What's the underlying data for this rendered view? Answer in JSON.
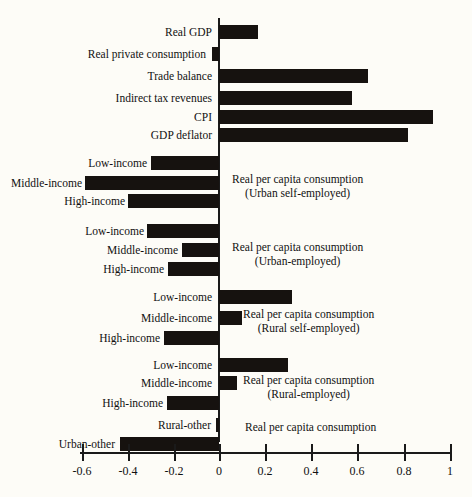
{
  "chart_data": {
    "type": "bar",
    "orientation": "horizontal",
    "title": "",
    "subtitle": "",
    "xlabel": "",
    "ylabel": "",
    "xlim": [
      -0.6,
      1.0
    ],
    "grid": false,
    "legend": "none",
    "axis": {
      "ticks": [
        -0.6,
        -0.4,
        -0.2,
        0,
        0.2,
        0.4,
        0.6,
        0.8,
        1
      ],
      "tick_labels": [
        "-0.6",
        "-0.4",
        "-0.2",
        "0",
        "0.2",
        "0.4",
        "0.6",
        "0.8",
        "1"
      ]
    },
    "categories": [
      "Real GDP",
      "Real private consumption",
      "Trade balance",
      "Indirect tax revenues",
      "CPI",
      "GDP deflator",
      "Low-income",
      "Middle-income",
      "High-income",
      "Low-income",
      "Middle-income",
      "High-income",
      "Low-income",
      "Middle-income",
      "High-income",
      "Low-income",
      "Middle-income",
      "High-income",
      "Rural-other",
      "Urban-other"
    ],
    "values": [
      0.17,
      -0.03,
      0.645,
      0.575,
      0.925,
      0.82,
      -0.295,
      -0.58,
      -0.395,
      -0.31,
      -0.16,
      -0.22,
      0.315,
      0.1,
      -0.24,
      0.3,
      0.078,
      -0.225,
      -0.015,
      -0.43
    ],
    "group_annotations": [
      "Real per capita consumption (Urban self-employed)",
      "Real per capita consumption (Urban-employed)",
      "Real per capita consumption (Rural self-employed)",
      "Real per capita consumption (Rural-employed)",
      "Real per capita consumption"
    ]
  },
  "bars": [
    {
      "label": "Real GDP",
      "value": 0.17,
      "top": 25,
      "label_right": 212
    },
    {
      "label": "Real private consumption",
      "value": -0.03,
      "top": 47,
      "label_right": 206
    },
    {
      "label": "Trade balance",
      "value": 0.645,
      "top": 69,
      "label_right": 212
    },
    {
      "label": "Indirect tax revenues",
      "value": 0.575,
      "top": 91,
      "label_right": 212
    },
    {
      "label": "CPI",
      "value": 0.925,
      "top": 110,
      "label_right": 212
    },
    {
      "label": "GDP deflator",
      "value": 0.82,
      "top": 128,
      "label_right": 212
    },
    {
      "label": "Low-income",
      "value": -0.295,
      "top": 156,
      "label_right": 147
    },
    {
      "label": "Middle-income",
      "value": -0.58,
      "top": 176,
      "label_right": 82
    },
    {
      "label": "High-income",
      "value": -0.395,
      "top": 194,
      "label_right": 125
    },
    {
      "label": "Low-income",
      "value": -0.31,
      "top": 224,
      "label_right": 144
    },
    {
      "label": "Middle-income",
      "value": -0.16,
      "top": 243,
      "label_right": 178
    },
    {
      "label": "High-income",
      "value": -0.22,
      "top": 262,
      "label_right": 164
    },
    {
      "label": "Low-income",
      "value": 0.315,
      "top": 290,
      "label_right": 212
    },
    {
      "label": "Middle-income",
      "value": 0.1,
      "top": 311,
      "label_right": 212
    },
    {
      "label": "High-income",
      "value": -0.24,
      "top": 331,
      "label_right": 160
    },
    {
      "label": "Low-income",
      "value": 0.3,
      "top": 358,
      "label_right": 212
    },
    {
      "label": "Middle-income",
      "value": 0.078,
      "top": 376,
      "label_right": 212
    },
    {
      "label": "High-income",
      "value": -0.225,
      "top": 396,
      "label_right": 163
    },
    {
      "label": "Rural-other",
      "value": -0.015,
      "top": 418,
      "label_right": 211
    },
    {
      "label": "Urban-other",
      "value": -0.43,
      "top": 437,
      "label_right": 115
    }
  ],
  "groups": [
    {
      "line1": "Real per capita consumption",
      "line2": "(Urban self-employed)",
      "left": 232,
      "top": 172
    },
    {
      "line1": "Real per capita consumption",
      "line2": "(Urban-employed)",
      "left": 232,
      "top": 240
    },
    {
      "line1": "Real per capita consumption",
      "line2": "(Rural self-employed)",
      "left": 243,
      "top": 307
    },
    {
      "line1": "Real per capita consumption",
      "line2": "(Rural-employed)",
      "left": 243,
      "top": 373
    },
    {
      "line1": "Real per capita consumption",
      "line2": "",
      "left": 245,
      "top": 420
    }
  ],
  "axis": {
    "ticks": [
      {
        "label": "-0.6",
        "x": 82
      },
      {
        "label": "-0.4",
        "x": 128
      },
      {
        "label": "-0.2",
        "x": 174
      },
      {
        "label": "0",
        "x": 219
      },
      {
        "label": "0.2",
        "x": 265
      },
      {
        "label": "0.4",
        "x": 311
      },
      {
        "label": "0.6",
        "x": 357
      },
      {
        "label": "0.8",
        "x": 404
      },
      {
        "label": "1",
        "x": 450
      }
    ]
  },
  "footer": {
    "note": ""
  },
  "colors": {
    "bar": "#16120f",
    "axis": "#1a1a1a",
    "text": "#111111",
    "background": "#fdfcf7"
  },
  "scale": {
    "zero_px": 219,
    "px_per_unit": 231
  }
}
